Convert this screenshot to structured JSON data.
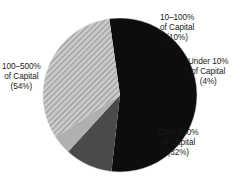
{
  "chart_data": {
    "type": "pie",
    "title": "",
    "subtitle": "",
    "xlabel": "",
    "ylabel": "",
    "legend_position": "none",
    "grid": false,
    "labels_outside": true,
    "categories": [
      "100–500% of Capital",
      "10–100% of Capital",
      "Under 10% of Capital",
      "Over 500% of Capital"
    ],
    "values": [
      54,
      10,
      4,
      32
    ],
    "units": "percent",
    "start_angle_deg": -8,
    "direction": "clockwise",
    "slices": [
      {
        "name": "100-500-of-capital",
        "line1": "100–500%",
        "line2": "of Capital",
        "line3": "(54%)",
        "value": 54,
        "color": "#0d0d0d",
        "fill_style": "solid"
      },
      {
        "name": "10-100-of-capital",
        "line1": "10–100%",
        "line2": "of Capital",
        "line3": "(10%)",
        "value": 10,
        "color": "#4a4a4a",
        "fill_style": "solid"
      },
      {
        "name": "under-10-of-capital",
        "line1": "Under 10%",
        "line2": "of Capital",
        "line3": "(4%)",
        "value": 4,
        "color": "#b0b0b0",
        "fill_style": "solid"
      },
      {
        "name": "over-500-of-capital",
        "line1": "Over 500%",
        "line2": "of Capital",
        "line3": "(32%)",
        "value": 32,
        "color": "#c8c8c8",
        "fill_style": "diagonal-hatch"
      }
    ]
  },
  "colors": {
    "background": "#ffffff",
    "text": "#1a1a1a",
    "slice_black": "#0d0d0d",
    "slice_dark_gray": "#4a4a4a",
    "slice_light_gray": "#b0b0b0",
    "slice_hatch_base": "#c8c8c8",
    "slice_hatch_line": "#8c8c8c"
  }
}
